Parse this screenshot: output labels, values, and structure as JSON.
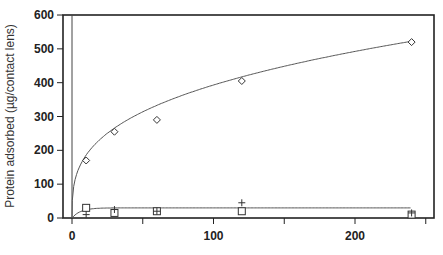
{
  "chart_data": {
    "type": "scatter",
    "title": "",
    "xlabel": "",
    "ylabel": "Protein adsorbed (µg/contact lens)",
    "xlim": [
      -6,
      255
    ],
    "ylim": [
      0,
      600
    ],
    "x_ticks": [
      0,
      50,
      100,
      150,
      200,
      250
    ],
    "x_tick_labels": [
      "0",
      "",
      "100",
      "",
      "200",
      ""
    ],
    "y_ticks": [
      0,
      100,
      200,
      300,
      400,
      500,
      600
    ],
    "y_tick_labels": [
      "0",
      "100",
      "200",
      "300",
      "400",
      "500",
      "600"
    ],
    "grid": false,
    "legend": null,
    "series": [
      {
        "name": "diamond",
        "marker": "diamond",
        "x": [
          10,
          30,
          60,
          120,
          240
        ],
        "y": [
          170,
          255,
          290,
          405,
          520
        ],
        "fit": "curve"
      },
      {
        "name": "square",
        "marker": "square",
        "x": [
          10,
          30,
          60,
          120,
          240
        ],
        "y": [
          30,
          15,
          20,
          20,
          10
        ],
        "fit": "curve"
      },
      {
        "name": "plus",
        "marker": "plus",
        "x": [
          10,
          30,
          60,
          120,
          240
        ],
        "y": [
          10,
          25,
          20,
          45,
          15
        ]
      }
    ]
  }
}
